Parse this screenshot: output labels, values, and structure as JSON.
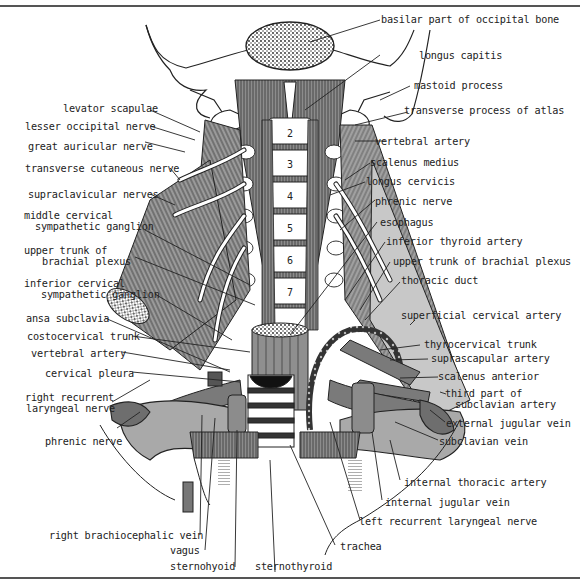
{
  "figure": {
    "vertebra_numbers": [
      "2",
      "3",
      "4",
      "5",
      "6",
      "7"
    ],
    "colors": {
      "ink": "#222222",
      "muscle": "#6b6b6b",
      "vessel": "#8a8a8a",
      "light": "#d0d0d0",
      "border": "#555555"
    }
  },
  "labels": {
    "right": [
      {
        "id": "basilar",
        "text": "basilar part of occipital bone"
      },
      {
        "id": "longus_capitis",
        "text": "longus capitis"
      },
      {
        "id": "mastoid",
        "text": "mastoid process"
      },
      {
        "id": "transverse_atlas",
        "text": "transverse process of atlas"
      },
      {
        "id": "vertebral_artery_r",
        "text": "vertebral artery"
      },
      {
        "id": "scalenus_medius",
        "text": "scalenus medius"
      },
      {
        "id": "longus_cervicis",
        "text": "longus cervicis"
      },
      {
        "id": "phrenic_r",
        "text": "phrenic nerve"
      },
      {
        "id": "esophagus",
        "text": "esophagus"
      },
      {
        "id": "inferior_thyroid",
        "text": "inferior thyroid artery"
      },
      {
        "id": "upper_trunk_r",
        "text": "upper trunk of brachial plexus"
      },
      {
        "id": "thoracic_duct",
        "text": "thoracic duct"
      },
      {
        "id": "superficial_cervical",
        "text": "superficial cervical artery"
      },
      {
        "id": "thyrocervical",
        "text": "thyrocervical trunk"
      },
      {
        "id": "suprascapular",
        "text": "suprascapular artery"
      },
      {
        "id": "scalenus_anterior",
        "text": "scalenus anterior"
      },
      {
        "id": "third_part_1",
        "text": "third part of"
      },
      {
        "id": "third_part_2",
        "text": "subclavian artery"
      },
      {
        "id": "external_jugular",
        "text": "external jugular vein"
      },
      {
        "id": "subclavian_vein",
        "text": "subclavian vein"
      },
      {
        "id": "internal_thoracic",
        "text": "internal thoracic artery"
      },
      {
        "id": "internal_jugular",
        "text": "internal jugular vein"
      },
      {
        "id": "left_recurrent",
        "text": "left recurrent laryngeal nerve"
      },
      {
        "id": "trachea",
        "text": "trachea"
      },
      {
        "id": "sternothyroid",
        "text": "sternothyroid"
      }
    ],
    "left": [
      {
        "id": "levator",
        "text": "levator scapulae"
      },
      {
        "id": "lesser_occipital",
        "text": "lesser occipital nerve"
      },
      {
        "id": "great_auricular",
        "text": "great auricular nerve"
      },
      {
        "id": "transverse_cutaneous",
        "text": "transverse cutaneous nerve"
      },
      {
        "id": "supraclavicular",
        "text": "supraclavicular nerves"
      },
      {
        "id": "middle_cervical_1",
        "text": "middle cervical"
      },
      {
        "id": "middle_cervical_2",
        "text": "sympathetic ganglion"
      },
      {
        "id": "upper_trunk_l_1",
        "text": "upper trunk of"
      },
      {
        "id": "upper_trunk_l_2",
        "text": "brachial plexus"
      },
      {
        "id": "inferior_cervical_1",
        "text": "inferior cervical"
      },
      {
        "id": "inferior_cervical_2",
        "text": "sympathetic ganglion"
      },
      {
        "id": "ansa",
        "text": "ansa subclavia"
      },
      {
        "id": "costocervical",
        "text": "costocervical trunk"
      },
      {
        "id": "vertebral_artery_l",
        "text": "vertebral artery"
      },
      {
        "id": "cervical_pleura",
        "text": "cervical pleura"
      },
      {
        "id": "right_recurrent_1",
        "text": "right recurrent"
      },
      {
        "id": "right_recurrent_2",
        "text": "laryngeal nerve"
      },
      {
        "id": "phrenic_l",
        "text": "phrenic nerve"
      },
      {
        "id": "right_brachiocephalic",
        "text": "right brachiocephalic vein"
      },
      {
        "id": "vagus",
        "text": "vagus"
      },
      {
        "id": "sternohyoid",
        "text": "sternohyoid"
      }
    ]
  }
}
